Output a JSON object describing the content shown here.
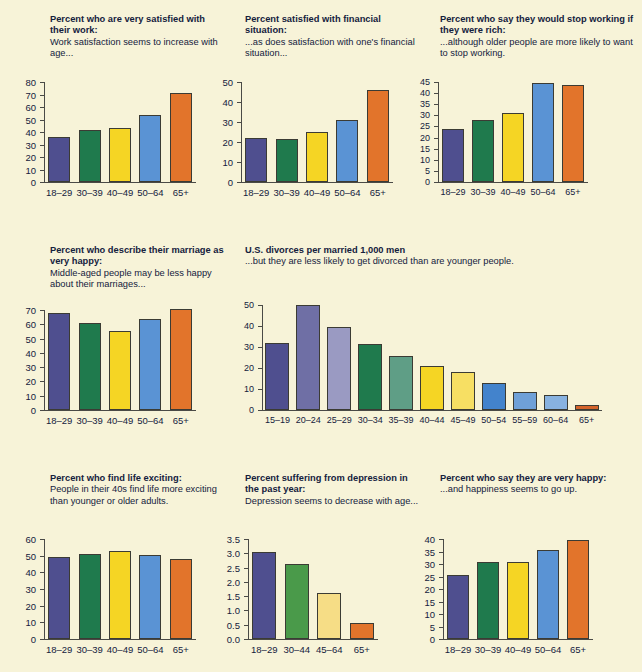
{
  "page": {
    "background": "#f7f3d8",
    "palette": {
      "purple": "#4f4f8f",
      "green": "#1f7a4d",
      "yellow": "#f5d524",
      "blue": "#5a93d4",
      "orange": "#e2742b",
      "purple_mid": "#6f6fa5",
      "purple_light": "#9a9ac2",
      "green_mid": "#5f9e86",
      "yellow_light": "#f7df63",
      "blue_mid": "#6fa0d8",
      "blue_light": "#88b2e0",
      "yellow_pale": "#f6dd86"
    }
  },
  "chart_data": [
    {
      "id": "work-satisfaction",
      "type": "bar",
      "title": "Percent who are very satisfied with their work:",
      "subtitle": "Work satisfaction seems to increase with age...",
      "categories": [
        "18–29",
        "30–39",
        "40–49",
        "50–64",
        "65+"
      ],
      "values": [
        36,
        42,
        43,
        54,
        71
      ],
      "colors": [
        "#4f4f8f",
        "#1f7a4d",
        "#f5d524",
        "#5a93d4",
        "#e2742b"
      ],
      "yticks": [
        0,
        10,
        20,
        30,
        40,
        50,
        60,
        70,
        80
      ],
      "ylim": [
        0,
        80
      ],
      "xlabel": "",
      "ylabel": "",
      "grid": false,
      "legend": "none"
    },
    {
      "id": "financial-satisfaction",
      "type": "bar",
      "title": "Percent satisfied with financial situation:",
      "subtitle": "...as does satisfaction with one's financial situation...",
      "categories": [
        "18–29",
        "30–39",
        "40–49",
        "50–64",
        "65+"
      ],
      "values": [
        22,
        21.5,
        25,
        31,
        46
      ],
      "colors": [
        "#4f4f8f",
        "#1f7a4d",
        "#f5d524",
        "#5a93d4",
        "#e2742b"
      ],
      "yticks": [
        0,
        10,
        20,
        30,
        40,
        50
      ],
      "ylim": [
        0,
        50
      ],
      "xlabel": "",
      "ylabel": "",
      "grid": false,
      "legend": "none"
    },
    {
      "id": "stop-working-if-rich",
      "type": "bar",
      "title": "Percent who say they would stop working if they were rich:",
      "subtitle": "...although older people are more likely to want to stop working.",
      "categories": [
        "18–29",
        "30–39",
        "40–49",
        "50–64",
        "65+"
      ],
      "values": [
        24,
        28,
        31,
        44.5,
        43.5
      ],
      "colors": [
        "#4f4f8f",
        "#1f7a4d",
        "#f5d524",
        "#5a93d4",
        "#e2742b"
      ],
      "yticks": [
        0,
        5,
        10,
        15,
        20,
        25,
        30,
        35,
        40,
        45
      ],
      "ylim": [
        0,
        45
      ],
      "xlabel": "",
      "ylabel": "",
      "grid": false,
      "legend": "none"
    },
    {
      "id": "marriage-very-happy",
      "type": "bar",
      "title": "Percent who describe their marriage as very happy:",
      "subtitle": "Middle-aged people may be less happy about their marriages...",
      "categories": [
        "18–29",
        "30–39",
        "40–49",
        "50–64",
        "65+"
      ],
      "values": [
        68,
        61,
        55,
        64,
        70.5
      ],
      "colors": [
        "#4f4f8f",
        "#1f7a4d",
        "#f5d524",
        "#5a93d4",
        "#e2742b"
      ],
      "yticks": [
        0,
        10,
        20,
        30,
        40,
        50,
        60,
        70
      ],
      "ylim": [
        0,
        70
      ],
      "xlabel": "",
      "ylabel": "",
      "grid": false,
      "legend": "none"
    },
    {
      "id": "divorces-per-1000-men",
      "type": "bar",
      "title": "U.S. divorces per married 1,000 men",
      "subtitle": "...but they are less likely to get divorced than are younger people.",
      "categories": [
        "15–19",
        "20–24",
        "25–29",
        "30–34",
        "35–39",
        "40–44",
        "45–49",
        "50–54",
        "55–59",
        "60–64",
        "65+"
      ],
      "values": [
        32,
        50,
        39.5,
        31.5,
        25.5,
        21,
        18,
        13,
        8.5,
        7,
        2.5
      ],
      "colors": [
        "#4f4f8f",
        "#6f6fa5",
        "#9a9ac2",
        "#1f7a4d",
        "#5f9e86",
        "#f5d524",
        "#f7df63",
        "#4383cc",
        "#6fa0d8",
        "#88b2e0",
        "#d4632a"
      ],
      "yticks": [
        0,
        10,
        20,
        30,
        40,
        50
      ],
      "ylim": [
        0,
        50
      ],
      "xlabel": "",
      "ylabel": "",
      "grid": false,
      "legend": "none"
    },
    {
      "id": "life-exciting",
      "type": "bar",
      "title": "Percent who find life exciting:",
      "subtitle": "People in their 40s find life more exciting than younger or older adults.",
      "categories": [
        "18–29",
        "30–39",
        "40–49",
        "50–64",
        "65+"
      ],
      "values": [
        49,
        51,
        53,
        50.5,
        48
      ],
      "colors": [
        "#4f4f8f",
        "#1f7a4d",
        "#f5d524",
        "#5a93d4",
        "#e2742b"
      ],
      "yticks": [
        0,
        10,
        20,
        30,
        40,
        50,
        60
      ],
      "ylim": [
        0,
        60
      ],
      "xlabel": "",
      "ylabel": "",
      "grid": false,
      "legend": "none"
    },
    {
      "id": "depression-past-year",
      "type": "bar",
      "title": "Percent suffering from depression in the past year:",
      "subtitle": "Depression seems to decrease with age...",
      "categories": [
        "18–29",
        "30–44",
        "45–64",
        "65+"
      ],
      "values": [
        3.05,
        2.62,
        1.62,
        0.55
      ],
      "colors": [
        "#4f4f8f",
        "#4a9a4a",
        "#f6dd86",
        "#e2742b"
      ],
      "yticks": [
        "0.0",
        "0.5",
        "1.0",
        "1.5",
        "2.0",
        "2.5",
        "3.0",
        "3.5"
      ],
      "ylim": [
        0,
        3.5
      ],
      "xlabel": "",
      "ylabel": "",
      "grid": false,
      "legend": "none"
    },
    {
      "id": "very-happy",
      "type": "bar",
      "title": "Percent who say they are very happy:",
      "subtitle": "...and happiness seems to go up.",
      "categories": [
        "18–29",
        "30–39",
        "40–49",
        "50–64",
        "65+"
      ],
      "values": [
        25.5,
        30.7,
        31,
        35.8,
        39.5
      ],
      "colors": [
        "#4f4f8f",
        "#1f7a4d",
        "#f5d524",
        "#5a93d4",
        "#e2742b"
      ],
      "yticks": [
        0,
        5,
        10,
        15,
        20,
        25,
        30,
        35,
        40
      ],
      "ylim": [
        0,
        40
      ],
      "xlabel": "",
      "ylabel": "",
      "grid": false,
      "legend": "none"
    }
  ]
}
